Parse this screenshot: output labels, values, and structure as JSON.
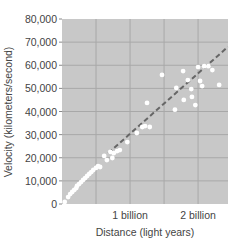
{
  "chart_data": {
    "type": "scatter",
    "title": "",
    "xlabel": "Distance (light years)",
    "ylabel": "Velocity (kilometers/second)",
    "xlim": [
      0,
      2.44
    ],
    "ylim": [
      0,
      80000
    ],
    "x_unit": "billion light years",
    "x_ticks": [
      {
        "value": 1,
        "label": "1 billion"
      },
      {
        "value": 2,
        "label": "2 billion"
      }
    ],
    "y_ticks": [
      {
        "value": 0,
        "label": "0"
      },
      {
        "value": 10000,
        "label": "10,000"
      },
      {
        "value": 20000,
        "label": "20,000"
      },
      {
        "value": 30000,
        "label": "30,000"
      },
      {
        "value": 40000,
        "label": "40,000"
      },
      {
        "value": 50000,
        "label": "50,000"
      },
      {
        "value": 60000,
        "label": "60,000"
      },
      {
        "value": 70000,
        "label": "70,000"
      },
      {
        "value": 80000,
        "label": "80,000"
      }
    ],
    "grid": true,
    "x_grid": [
      0.5,
      1,
      1.5,
      2
    ],
    "legend": null,
    "series": [
      {
        "name": "Galaxies",
        "style": "white dots",
        "points": [
          [
            0.04,
            900
          ],
          [
            0.09,
            3000
          ],
          [
            0.12,
            4300
          ],
          [
            0.15,
            5200
          ],
          [
            0.18,
            6100
          ],
          [
            0.21,
            6900
          ],
          [
            0.22,
            7800
          ],
          [
            0.25,
            8600
          ],
          [
            0.28,
            9500
          ],
          [
            0.31,
            10400
          ],
          [
            0.34,
            11200
          ],
          [
            0.37,
            12100
          ],
          [
            0.4,
            13000
          ],
          [
            0.43,
            13800
          ],
          [
            0.46,
            14700
          ],
          [
            0.5,
            15600
          ],
          [
            0.53,
            16400
          ],
          [
            0.56,
            16000
          ],
          [
            0.62,
            20800
          ],
          [
            0.66,
            19000
          ],
          [
            0.71,
            22500
          ],
          [
            0.74,
            19900
          ],
          [
            0.76,
            22000
          ],
          [
            0.81,
            22900
          ],
          [
            0.85,
            23300
          ],
          [
            0.96,
            26800
          ],
          [
            1.1,
            30700
          ],
          [
            1.18,
            33300
          ],
          [
            1.22,
            33700
          ],
          [
            1.29,
            33300
          ],
          [
            1.25,
            43700
          ],
          [
            1.47,
            55800
          ],
          [
            1.68,
            50200
          ],
          [
            1.78,
            57500
          ],
          [
            1.66,
            40800
          ],
          [
            1.79,
            45000
          ],
          [
            1.85,
            53600
          ],
          [
            1.9,
            49700
          ],
          [
            1.91,
            46300
          ],
          [
            1.96,
            42800
          ],
          [
            2.0,
            59200
          ],
          [
            2.03,
            53200
          ],
          [
            2.06,
            51000
          ],
          [
            2.09,
            59600
          ],
          [
            2.15,
            59600
          ],
          [
            2.21,
            57900
          ],
          [
            2.31,
            51500
          ]
        ]
      }
    ],
    "trendline": {
      "style": "dashed",
      "color": "#666666",
      "from": [
        0.68,
        22000
      ],
      "to": [
        2.44,
        68000
      ]
    },
    "colors": {
      "plot_bg": "#c8c8c8",
      "grid": "#a8a8a8",
      "point": "#ffffff",
      "text": "#444444"
    }
  }
}
